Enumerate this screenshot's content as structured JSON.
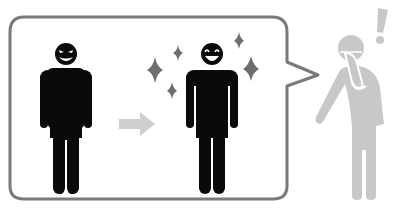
{
  "illustration": {
    "description": "Pictogram: a speech bubble shows an evil-grinning figure turning into a smiling sparkling figure; a gray figure outside holds its face with an exclamation mark",
    "colors": {
      "background": "#ffffff",
      "bubble_border": "#7a7a7a",
      "figure_black": "#0a0a0a",
      "sparkle": "#6e6e6e",
      "arrow": "#cfcfcf",
      "figure_gray": "#c8c8c8"
    },
    "bubble": {
      "label": "speech-bubble"
    },
    "before_figure": {
      "label": "evil-grin-person",
      "expression": "evil-grin"
    },
    "arrow": {
      "label": "transform-arrow",
      "direction": "right"
    },
    "after_figure": {
      "label": "smiling-person",
      "expression": "happy",
      "sparkles": 5
    },
    "observer": {
      "label": "surprised-person",
      "symbol": "!"
    }
  }
}
